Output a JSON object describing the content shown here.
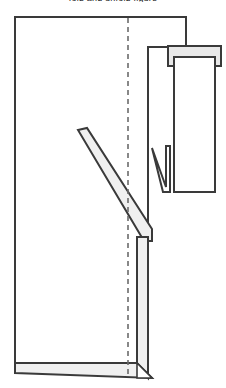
{
  "figure": {
    "caption_fragment": "fold and unfold figure",
    "stroke_color": "#3a3a3a",
    "fill_white": "#ffffff",
    "fill_gray": "#e8e8e8",
    "fill_gray_light": "#f0f0f0",
    "centerline_color": "#6b6b6b",
    "stroke_width": 2,
    "thin_stroke_width": 1.2
  },
  "shapes": {
    "main_panel": {
      "name": "main-panel-outline",
      "points": "15,17 186,17 186,47 148,47 148,373 15,373"
    },
    "main_panel_simple": {
      "name": "main-panel-body",
      "points": "15,17 186,17 186,47 148,47 148,373 15,373"
    },
    "centerline": {
      "name": "fold-centerline",
      "x": 128,
      "y_top": 18,
      "y_bottom": 376,
      "dash": "5,4"
    },
    "gray_tab": {
      "name": "upper-gray-tab",
      "points": "168,46 221,46 221,66 168,66"
    },
    "white_card": {
      "name": "right-white-card",
      "points": "174,57 215,57 215,192 174,192"
    },
    "notch": {
      "name": "v-notch",
      "points": "152,148 166,187 166,146 170,146 170,192 163,192"
    },
    "diagonal_strip": {
      "name": "diagonal-fold-strip",
      "points": "78,130 87,128 152,229 152,241 144,241"
    },
    "vertical_strip": {
      "name": "right-vertical-strip",
      "points": "137,237 148,237 148,378 137,367"
    },
    "bottom_strip": {
      "name": "bottom-horizontal-strip",
      "points": "15,363 137,363 152,378 15,373"
    },
    "cross_tail_right": {
      "name": "bottom-right-cross-tail",
      "points": "137,363 152,378 137,378"
    },
    "stem": {
      "name": "tab-connector-stem",
      "x": 186,
      "y_top": 17,
      "y_bottom": 47
    }
  },
  "labels": {
    "figure_type": "line-diagram"
  }
}
